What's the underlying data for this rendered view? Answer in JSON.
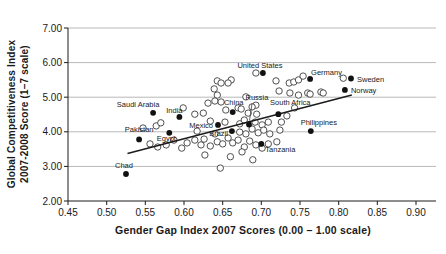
{
  "colors": {
    "background": "#ffffff",
    "grid": "#b9b9b9",
    "axis": "#1a1a1a",
    "point_stroke": "#3d3d3d",
    "point_fill_open": "#ffffff",
    "point_fill_labeled": "#111111",
    "trend": "#1c1c1c",
    "text": "#1a1a1a"
  },
  "chart_data": {
    "type": "scatter",
    "title": "",
    "xlabel": "Gender Gap Index 2007 Scores (0.00 – 1.00 scale)",
    "ylabel_line1": "Global Competitiveness Index",
    "ylabel_line2": "2007-2008 Score (1–7 scale)",
    "xlim": [
      0.45,
      0.9
    ],
    "ylim": [
      2.0,
      7.0
    ],
    "grid": "horizontal",
    "legend": "none",
    "x_ticks": [
      {
        "v": 0.45,
        "label": "0.45"
      },
      {
        "v": 0.5,
        "label": "0.50"
      },
      {
        "v": 0.55,
        "label": "0.55"
      },
      {
        "v": 0.6,
        "label": "0.60"
      },
      {
        "v": 0.65,
        "label": "0.65"
      },
      {
        "v": 0.7,
        "label": "0.70"
      },
      {
        "v": 0.75,
        "label": "0.75"
      },
      {
        "v": 0.8,
        "label": "0.80"
      },
      {
        "v": 0.85,
        "label": "0.85"
      },
      {
        "v": 0.9,
        "label": "0.90"
      }
    ],
    "y_ticks": [
      {
        "v": 2.0,
        "label": "2.00"
      },
      {
        "v": 3.0,
        "label": "3.00"
      },
      {
        "v": 4.0,
        "label": "4.00"
      },
      {
        "v": 5.0,
        "label": "5.00"
      },
      {
        "v": 6.0,
        "label": "6.00"
      },
      {
        "v": 7.0,
        "label": "7.00"
      }
    ],
    "trendline": {
      "x1": 0.527,
      "y1": 3.37,
      "x2": 0.817,
      "y2": 5.06
    },
    "labeled_points": [
      {
        "name": "United States",
        "x": 0.702,
        "y": 5.7,
        "anchor": "middle",
        "label_dx": -3,
        "label_dy": -5
      },
      {
        "name": "Germany",
        "x": 0.763,
        "y": 5.53,
        "anchor": "start",
        "label_dx": 1,
        "label_dy": -4
      },
      {
        "name": "Sweden",
        "x": 0.816,
        "y": 5.54,
        "anchor": "start",
        "label_dx": 6,
        "label_dy": 3
      },
      {
        "name": "Norway",
        "x": 0.808,
        "y": 5.21,
        "anchor": "start",
        "label_dx": 6,
        "label_dy": 3
      },
      {
        "name": "Saudi Arabia",
        "x": 0.56,
        "y": 4.55,
        "anchor": "middle",
        "label_dx": -15,
        "label_dy": -6
      },
      {
        "name": "India",
        "x": 0.594,
        "y": 4.43,
        "anchor": "middle",
        "label_dx": -5,
        "label_dy": -4
      },
      {
        "name": "China",
        "x": 0.663,
        "y": 4.57,
        "anchor": "middle",
        "label_dx": 1,
        "label_dy": -7
      },
      {
        "name": "Russia",
        "x": 0.684,
        "y": 4.21,
        "anchor": "middle",
        "label_dx": 8,
        "label_dy": -25,
        "leader": true
      },
      {
        "name": "South Africa",
        "x": 0.722,
        "y": 4.51,
        "anchor": "middle",
        "label_dx": 12,
        "label_dy": -9
      },
      {
        "name": "Mexico",
        "x": 0.644,
        "y": 4.2,
        "anchor": "end",
        "label_dx": -5,
        "label_dy": 3
      },
      {
        "name": "Brazil",
        "x": 0.662,
        "y": 4.02,
        "anchor": "end",
        "label_dx": -4,
        "label_dy": 5
      },
      {
        "name": "Egypt",
        "x": 0.581,
        "y": 3.97,
        "anchor": "middle",
        "label_dx": -3,
        "label_dy": 8
      },
      {
        "name": "Pakistan",
        "x": 0.542,
        "y": 3.78,
        "anchor": "middle",
        "label_dx": 0,
        "label_dy": -7
      },
      {
        "name": "Philippines",
        "x": 0.764,
        "y": 4.02,
        "anchor": "middle",
        "label_dx": 8,
        "label_dy": -6
      },
      {
        "name": "Tanzania",
        "x": 0.7,
        "y": 3.65,
        "anchor": "start",
        "label_dx": 4,
        "label_dy": 8
      },
      {
        "name": "Chad",
        "x": 0.525,
        "y": 2.78,
        "anchor": "middle",
        "label_dx": -2,
        "label_dy": -6
      }
    ],
    "unlabeled_points": [
      [
        0.693,
        5.7
      ],
      [
        0.643,
        5.47
      ],
      [
        0.648,
        5.41
      ],
      [
        0.639,
        5.24
      ],
      [
        0.643,
        5.06
      ],
      [
        0.661,
        5.5
      ],
      [
        0.657,
        5.41
      ],
      [
        0.719,
        5.47
      ],
      [
        0.736,
        5.41
      ],
      [
        0.742,
        5.44
      ],
      [
        0.748,
        5.5
      ],
      [
        0.754,
        5.61
      ],
      [
        0.806,
        5.55
      ],
      [
        0.777,
        5.15
      ],
      [
        0.76,
        5.12
      ],
      [
        0.737,
        5.12
      ],
      [
        0.723,
        5.18
      ],
      [
        0.748,
        5.06
      ],
      [
        0.763,
        5.09
      ],
      [
        0.78,
        5.12
      ],
      [
        0.743,
        4.69
      ],
      [
        0.693,
        4.77
      ],
      [
        0.631,
        4.83
      ],
      [
        0.64,
        4.89
      ],
      [
        0.648,
        4.86
      ],
      [
        0.67,
        4.69
      ],
      [
        0.688,
        4.72
      ],
      [
        0.599,
        4.69
      ],
      [
        0.68,
        5.01
      ],
      [
        0.614,
        4.51
      ],
      [
        0.625,
        4.54
      ],
      [
        0.654,
        4.63
      ],
      [
        0.674,
        4.66
      ],
      [
        0.683,
        4.54
      ],
      [
        0.694,
        4.51
      ],
      [
        0.634,
        4.31
      ],
      [
        0.653,
        4.28
      ],
      [
        0.672,
        4.23
      ],
      [
        0.678,
        4.34
      ],
      [
        0.692,
        4.28
      ],
      [
        0.701,
        4.2
      ],
      [
        0.709,
        4.28
      ],
      [
        0.733,
        4.46
      ],
      [
        0.726,
        4.28
      ],
      [
        0.724,
        4.05
      ],
      [
        0.617,
        4.02
      ],
      [
        0.64,
        3.94
      ],
      [
        0.672,
        3.99
      ],
      [
        0.68,
        3.94
      ],
      [
        0.688,
        4.08
      ],
      [
        0.696,
        3.97
      ],
      [
        0.703,
        4.05
      ],
      [
        0.711,
        3.94
      ],
      [
        0.556,
        3.65
      ],
      [
        0.566,
        3.56
      ],
      [
        0.577,
        3.62
      ],
      [
        0.587,
        3.76
      ],
      [
        0.597,
        3.53
      ],
      [
        0.604,
        3.68
      ],
      [
        0.614,
        3.76
      ],
      [
        0.622,
        3.62
      ],
      [
        0.626,
        3.79
      ],
      [
        0.634,
        3.59
      ],
      [
        0.643,
        3.71
      ],
      [
        0.65,
        3.65
      ],
      [
        0.657,
        3.82
      ],
      [
        0.663,
        3.68
      ],
      [
        0.67,
        3.76
      ],
      [
        0.678,
        3.56
      ],
      [
        0.685,
        3.73
      ],
      [
        0.693,
        3.62
      ],
      [
        0.701,
        3.53
      ],
      [
        0.709,
        3.65
      ],
      [
        0.72,
        3.71
      ],
      [
        0.547,
        4.11
      ],
      [
        0.564,
        4.17
      ],
      [
        0.57,
        4.26
      ],
      [
        0.627,
        3.33
      ],
      [
        0.66,
        3.28
      ],
      [
        0.689,
        3.19
      ],
      [
        0.647,
        2.95
      ],
      [
        0.675,
        3.42
      ]
    ]
  }
}
